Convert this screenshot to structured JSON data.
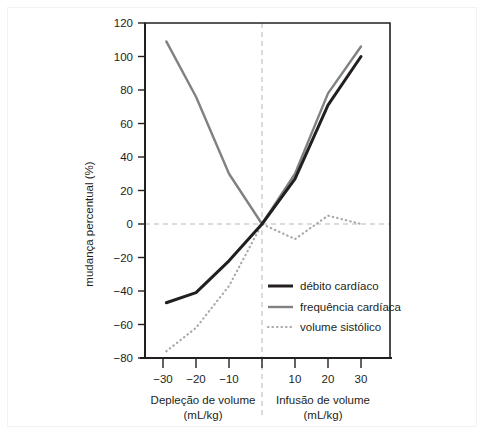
{
  "chart_data": {
    "type": "line",
    "title": "",
    "subtitle": "",
    "xlabel_left": "Depleção de volume",
    "xlabel_left_units": "(mL/kg)",
    "xlabel_right": "Infusão de volume",
    "xlabel_right_units": "(mL/kg)",
    "ylabel": "mudança percentual (%)",
    "xlim": [
      -36,
      37
    ],
    "ylim": [
      -80,
      120
    ],
    "xticks": [
      -30,
      -20,
      -10,
      0,
      10,
      20,
      30
    ],
    "xticklabels": [
      "−30",
      "−20",
      "−10",
      "",
      "10",
      "20",
      "30"
    ],
    "yticks": [
      -80,
      -60,
      -40,
      -20,
      0,
      20,
      40,
      60,
      80,
      100,
      120
    ],
    "yticklabels": [
      "−80",
      "−60",
      "−40",
      "−20",
      "0",
      "20",
      "40",
      "60",
      "80",
      "100",
      "120"
    ],
    "grid": false,
    "zero_line_x": 0,
    "zero_line_y": 0,
    "legend_position": "lower-right-inside",
    "series": [
      {
        "name": "débito cardíaco",
        "color": "#231f20",
        "style": "solid",
        "width": 3.0,
        "x": [
          -29,
          -20,
          -10,
          0,
          10,
          20,
          30
        ],
        "y": [
          -47,
          -41,
          -22,
          0,
          27,
          71,
          100
        ]
      },
      {
        "name": "frequência cardíaca",
        "color": "#7f8183",
        "style": "solid",
        "width": 2.4,
        "x": [
          -29,
          -20,
          -10,
          0,
          10,
          20,
          30
        ],
        "y": [
          109,
          76,
          30,
          0,
          30,
          78,
          106
        ]
      },
      {
        "name": "volume sistólico",
        "color": "#a7a9ac",
        "style": "dotted",
        "width": 2.2,
        "x": [
          -29,
          -20,
          -10,
          0,
          10,
          20,
          30
        ],
        "y": [
          -76,
          -62,
          -37,
          0,
          -9,
          5,
          0
        ]
      }
    ]
  },
  "legend": {
    "items": [
      {
        "label": "débito cardíaco",
        "swatch": "thick-black-line"
      },
      {
        "label": "frequência cardíaca",
        "swatch": "gray-line"
      },
      {
        "label": "volume sistólico",
        "swatch": "gray-dotted-line"
      }
    ]
  },
  "colors": {
    "axis": "#231f20",
    "cardiac_output": "#231f20",
    "heart_rate": "#7f8183",
    "stroke_volume": "#a7a9ac",
    "dashed_guide": "#b5b7b9",
    "background": "#ffffff"
  }
}
